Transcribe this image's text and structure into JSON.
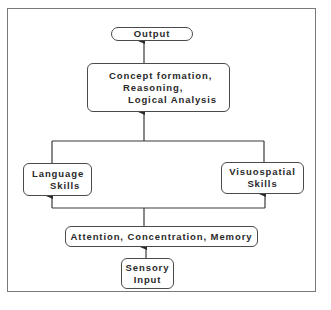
{
  "diagram": {
    "nodes": {
      "output": {
        "label": "Output"
      },
      "concept": {
        "lines": [
          "Concept  formation,",
          "Reasoning,",
          "Logical  Analysis"
        ]
      },
      "language": {
        "lines": [
          "Language",
          "Skills"
        ]
      },
      "visuospatial": {
        "lines": [
          "Visuospatial",
          "Skills"
        ]
      },
      "attention": {
        "label": "Attention,  Concentration,  Memory"
      },
      "sensory": {
        "lines": [
          "Sensory",
          "Input"
        ]
      }
    },
    "edges": [
      {
        "from": "sensory",
        "to": "attention"
      },
      {
        "from": "attention",
        "to": "language"
      },
      {
        "from": "attention",
        "to": "visuospatial"
      },
      {
        "from": "language",
        "to": "concept"
      },
      {
        "from": "visuospatial",
        "to": "concept"
      },
      {
        "from": "concept",
        "to": "output"
      }
    ],
    "colors": {
      "line": "#3a3a3a",
      "frame": "#7a7a7a",
      "text": "#2a2a2a"
    }
  }
}
